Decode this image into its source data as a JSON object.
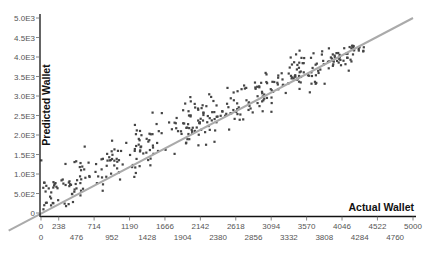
{
  "chart_data": {
    "type": "scatter",
    "title": "",
    "xlabel": "Actual Wallet",
    "ylabel": "Predicted Wallet",
    "xlim": [
      0,
      5000
    ],
    "ylim": [
      0,
      5000
    ],
    "x_ticks_row1": [
      0,
      238,
      714,
      1190,
      1666,
      2142,
      2618,
      3094,
      3570,
      4046,
      4522,
      5000
    ],
    "x_ticks_row2": [
      0,
      476,
      952,
      1428,
      1904,
      2380,
      2856,
      3332,
      3808,
      4284,
      4760
    ],
    "y_ticks": [
      "0",
      "5.0E2",
      "1.0E3",
      "1.5E3",
      "2.0E3",
      "2.5E3",
      "3.0E3",
      "3.5E3",
      "4.0E3",
      "4.5E3",
      "5.0E3"
    ],
    "y_tick_values": [
      0,
      500,
      1000,
      1500,
      2000,
      2500,
      3000,
      3500,
      4000,
      4500,
      5000
    ],
    "reference_line": {
      "from": [
        -300,
        -300
      ],
      "to": [
        5000,
        5000
      ],
      "color": "#aaaaaa",
      "label": "y = x"
    },
    "grid": false,
    "legend": null,
    "point_color": "#444444",
    "approx_point_count": 400,
    "trend_description": "Points cluster along the diagonal; predictions exceed actual for low values (0–1500) and are close for higher values"
  }
}
